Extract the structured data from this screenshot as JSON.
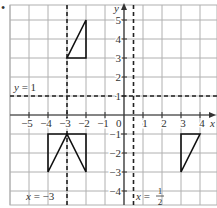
{
  "question_marker": "•",
  "grid": {
    "x_min": -6,
    "x_max": 5,
    "y_min": -5,
    "y_max": 6,
    "origin_px": [
      124,
      115
    ],
    "unit_px": 19,
    "line_color": "#b0b0b0",
    "axis_color": "#333333"
  },
  "axes": {
    "x_label": "x",
    "y_label": "y",
    "origin_label": "0",
    "x_ticks": [
      "-5",
      "-4",
      "-3",
      "-2",
      "-1",
      "1",
      "2",
      "3",
      "4"
    ],
    "x_tick_values": [
      -5,
      -4,
      -3,
      -2,
      -1,
      1,
      2,
      3,
      4
    ],
    "y_ticks": [
      "5",
      "4",
      "3",
      "2",
      "1",
      "-1",
      "-2",
      "-3",
      "-4"
    ],
    "y_tick_values": [
      5,
      4,
      3,
      2,
      1,
      -1,
      -2,
      -3,
      -4
    ]
  },
  "lines": [
    {
      "name": "y = 1",
      "label": "y = 1",
      "type": "horizontal",
      "value": 1
    },
    {
      "name": "x = -3",
      "label_left": "x = −3",
      "type": "vertical",
      "value": -3
    },
    {
      "name": "x = 1/2",
      "label_left": "x = ",
      "label_num": "1",
      "label_den": "2",
      "type": "vertical",
      "value": 0.5
    }
  ],
  "shapes": [
    {
      "name": "triangle-top",
      "points": [
        [
          -3,
          3
        ],
        [
          -2,
          3
        ],
        [
          -2,
          5
        ]
      ]
    },
    {
      "name": "triangle-bottom-left-a",
      "points": [
        [
          -4,
          -1
        ],
        [
          -3,
          -1
        ],
        [
          -4,
          -3
        ]
      ]
    },
    {
      "name": "triangle-bottom-left-b",
      "points": [
        [
          -3,
          -1
        ],
        [
          -2,
          -1
        ],
        [
          -2,
          -3
        ]
      ]
    },
    {
      "name": "triangle-bottom-right",
      "points": [
        [
          3,
          -1
        ],
        [
          4,
          -1
        ],
        [
          3,
          -3
        ]
      ]
    }
  ]
}
